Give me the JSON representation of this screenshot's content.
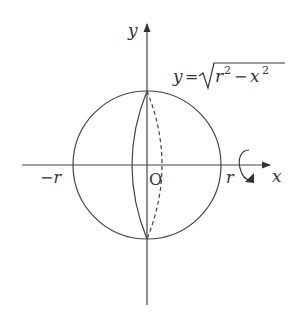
{
  "diagram": {
    "type": "sphere-of-revolution",
    "axes": {
      "x_label": "x",
      "y_label": "y",
      "origin_label": "O"
    },
    "tick_labels": {
      "left": "−r",
      "right": "r"
    },
    "equation": {
      "lhs": "y",
      "eq": "=",
      "radicand": "r² − x²",
      "full_text": "y = √(r² − x²)"
    },
    "rotation_indicator": "rotation about x-axis",
    "colors": {
      "stroke": "#333333",
      "background": "#ffffff"
    }
  }
}
